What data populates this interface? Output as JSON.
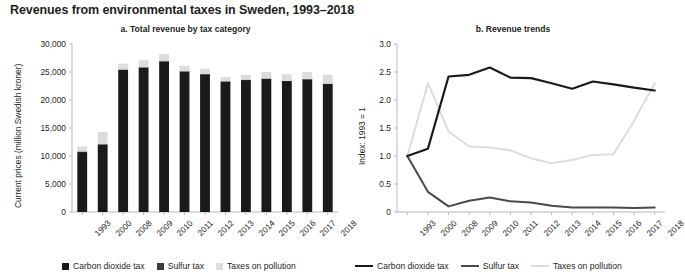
{
  "figure": {
    "title": "Revenues from environmental taxes in Sweden, 1993–2018"
  },
  "panel_a": {
    "title": "a. Total revenue by tax category",
    "ylabel": "Current prices (million Swedish kroner)",
    "yticks": [
      "0",
      "5,000",
      "10,000",
      "15,000",
      "20,000",
      "25,000",
      "30,000"
    ],
    "xticks": [
      "1993",
      "2000",
      "2008",
      "2009",
      "2010",
      "2011",
      "2012",
      "2013",
      "2014",
      "2015",
      "2016",
      "2017",
      "2018"
    ],
    "legend": [
      {
        "label": "Carbon dioxide tax",
        "color": "#1a1a1a"
      },
      {
        "label": "Sulfur tax",
        "color": "#3d3d3d"
      },
      {
        "label": "Taxes on pollution",
        "color": "#dcdcdc"
      }
    ]
  },
  "panel_b": {
    "title": "b. Revenue trends",
    "ylabel": "Index: 1993 = 1",
    "yticks": [
      "0",
      "0.5",
      "1.0",
      "1.5",
      "2.0",
      "2.5",
      "3.0"
    ],
    "xticks": [
      "1993",
      "2000",
      "2008",
      "2009",
      "2010",
      "2011",
      "2012",
      "2013",
      "2014",
      "2015",
      "2016",
      "2017",
      "2018"
    ],
    "legend": [
      {
        "label": "Carbon dioxide tax",
        "color": "#1a1a1a"
      },
      {
        "label": "Sulfur tax",
        "color": "#4a4a4a"
      },
      {
        "label": "Taxes on pollution",
        "color": "#dcdcdc"
      }
    ]
  },
  "chart_data": [
    {
      "type": "bar",
      "id": "panel-a-stacked-bar",
      "title": "a. Total revenue by tax category",
      "stacked": true,
      "xlabel": "",
      "ylabel": "Current prices (million Swedish kroner)",
      "ylim": [
        0,
        30000
      ],
      "ytick_values": [
        0,
        5000,
        10000,
        15000,
        20000,
        25000,
        30000
      ],
      "grid": false,
      "legend_position": "bottom",
      "categories": [
        "1993",
        "2000",
        "2008",
        "2009",
        "2010",
        "2011",
        "2012",
        "2013",
        "2014",
        "2015",
        "2016",
        "2017",
        "2018"
      ],
      "series": [
        {
          "name": "Carbon dioxide tax",
          "color": "#1a1a1a",
          "values": [
            10700,
            12000,
            25400,
            25800,
            26900,
            25100,
            24600,
            23300,
            23600,
            23800,
            23400,
            23700,
            22900
          ]
        },
        {
          "name": "Sulfur tax",
          "color": "#3d3d3d",
          "values": [
            110,
            120,
            40,
            35,
            30,
            25,
            25,
            20,
            20,
            20,
            20,
            15,
            15
          ]
        },
        {
          "name": "Taxes on pollution",
          "color": "#dcdcdc",
          "values": [
            890,
            2180,
            1060,
            1265,
            1270,
            975,
            975,
            780,
            880,
            1180,
            1180,
            1285,
            1585
          ]
        }
      ],
      "totals": [
        11700,
        14300,
        26500,
        27100,
        28200,
        26100,
        25600,
        24100,
        24500,
        25000,
        24600,
        25000,
        24500
      ]
    },
    {
      "type": "line",
      "id": "panel-b-index-lines",
      "title": "b. Revenue trends",
      "xlabel": "",
      "ylabel": "Index: 1993 = 1",
      "ylim": [
        0,
        3.0
      ],
      "ytick_values": [
        0,
        0.5,
        1.0,
        1.5,
        2.0,
        2.5,
        3.0
      ],
      "grid": false,
      "legend_position": "bottom",
      "x": [
        "1993",
        "2000",
        "2008",
        "2009",
        "2010",
        "2011",
        "2012",
        "2013",
        "2014",
        "2015",
        "2016",
        "2017",
        "2018"
      ],
      "series": [
        {
          "name": "Carbon dioxide tax",
          "color": "#1a1a1a",
          "values": [
            1.0,
            1.13,
            2.42,
            2.45,
            2.58,
            2.4,
            2.39,
            2.3,
            2.2,
            2.33,
            2.28,
            2.22,
            2.17
          ]
        },
        {
          "name": "Sulfur tax",
          "color": "#4a4a4a",
          "values": [
            1.0,
            0.36,
            0.1,
            0.2,
            0.26,
            0.19,
            0.17,
            0.11,
            0.08,
            0.08,
            0.08,
            0.07,
            0.08
          ]
        },
        {
          "name": "Taxes on pollution",
          "color": "#dcdcdc",
          "values": [
            1.0,
            2.3,
            1.44,
            1.17,
            1.15,
            1.1,
            0.96,
            0.87,
            0.93,
            1.02,
            1.03,
            1.63,
            2.3
          ]
        }
      ]
    }
  ]
}
